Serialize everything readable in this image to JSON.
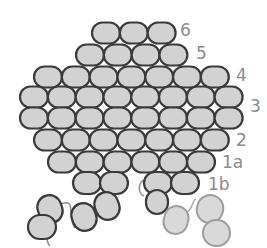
{
  "diagram": {
    "colors": {
      "bead_fill": "#d2d2d2",
      "bead_stroke": "#3a3a3a",
      "faded_fill": "#d9d9d9",
      "faded_stroke": "#9e9e9e",
      "thread": "#8c8c8c",
      "label": "#8a8a8a"
    },
    "rows": [
      {
        "label": "6",
        "y": 33,
        "start_x": 106,
        "count": 3
      },
      {
        "label": "5",
        "y": 55,
        "start_x": 90,
        "count": 4
      },
      {
        "label": "4",
        "y": 77,
        "start_x": 48,
        "count": 7
      },
      {
        "label": "",
        "y": 97,
        "start_x": 34,
        "count": 8
      },
      {
        "label": "3",
        "y": 118,
        "start_x": 34,
        "count": 8
      },
      {
        "label": "2",
        "y": 140,
        "start_x": 48,
        "count": 7
      },
      {
        "label": "1a",
        "y": 162,
        "start_x": 62,
        "count": 6
      }
    ],
    "labels": [
      {
        "text": "6",
        "x": 180,
        "y": 22
      },
      {
        "text": "5",
        "x": 196,
        "y": 45
      },
      {
        "text": "4",
        "x": 236,
        "y": 67
      },
      {
        "text": "3",
        "x": 250,
        "y": 98
      },
      {
        "text": "2",
        "x": 236,
        "y": 132
      },
      {
        "text": "1a",
        "x": 222,
        "y": 154
      },
      {
        "text": "1b",
        "x": 208,
        "y": 176
      }
    ]
  }
}
